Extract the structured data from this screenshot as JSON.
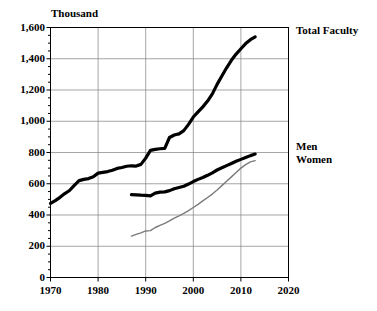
{
  "chart_data": {
    "type": "line",
    "title": "",
    "subtitle": "",
    "unit_label": "Thousand",
    "xlabel": "",
    "ylabel": "",
    "xlim": [
      1970,
      2020
    ],
    "ylim": [
      0,
      1600
    ],
    "grid": true,
    "legend_position": "right-inline",
    "x_ticks": [
      "1970",
      "1980",
      "1990",
      "2000",
      "2010",
      "2020"
    ],
    "x_tick_values": [
      1970,
      1980,
      1990,
      2000,
      2010,
      2020
    ],
    "y_ticks": [
      "0",
      "200",
      "400",
      "600",
      "800",
      "1,000",
      "1,200",
      "1,400",
      "1,600"
    ],
    "y_tick_values": [
      0,
      200,
      400,
      600,
      800,
      1000,
      1200,
      1400,
      1600
    ],
    "y_minor_step": 50,
    "series": [
      {
        "name": "Total Faculty",
        "color": "#000000",
        "width": 3.2,
        "x": [
          1970,
          1971,
          1972,
          1973,
          1974,
          1975,
          1976,
          1977,
          1978,
          1979,
          1980,
          1981,
          1982,
          1983,
          1984,
          1985,
          1986,
          1987,
          1988,
          1989,
          1990,
          1991,
          1992,
          1993,
          1994,
          1995,
          1996,
          1997,
          1998,
          1999,
          2000,
          2001,
          2002,
          2003,
          2004,
          2005,
          2006,
          2007,
          2008,
          2009,
          2010,
          2011,
          2012,
          2013
        ],
        "values": [
          474,
          492,
          513,
          537,
          557,
          590,
          620,
          628,
          633,
          645,
          668,
          673,
          678,
          686,
          698,
          704,
          712,
          715,
          713,
          724,
          764,
          814,
          820,
          824,
          826,
          896,
          912,
          919,
          940,
          980,
          1027,
          1060,
          1092,
          1129,
          1175,
          1236,
          1290,
          1342,
          1390,
          1430,
          1464,
          1497,
          1522,
          1540
        ]
      },
      {
        "name": "Men",
        "color": "#000000",
        "width": 3.2,
        "x": [
          1987,
          1988,
          1989,
          1990,
          1991,
          1992,
          1993,
          1994,
          1995,
          1996,
          1997,
          1998,
          1999,
          2000,
          2001,
          2002,
          2003,
          2004,
          2005,
          2006,
          2007,
          2008,
          2009,
          2010,
          2011,
          2012,
          2013
        ],
        "values": [
          530,
          529,
          527,
          526,
          522,
          540,
          546,
          548,
          556,
          568,
          576,
          584,
          598,
          614,
          628,
          640,
          654,
          670,
          688,
          702,
          716,
          730,
          744,
          756,
          768,
          780,
          790
        ]
      },
      {
        "name": "Women",
        "color": "#7a7a7a",
        "width": 1.4,
        "x": [
          1987,
          1988,
          1989,
          1990,
          1991,
          1992,
          1993,
          1994,
          1995,
          1996,
          1997,
          1998,
          1999,
          2000,
          2001,
          2002,
          2003,
          2004,
          2005,
          2006,
          2007,
          2008,
          2009,
          2010,
          2011,
          2012,
          2013
        ],
        "values": [
          265,
          276,
          286,
          298,
          300,
          320,
          334,
          346,
          362,
          380,
          394,
          410,
          428,
          448,
          468,
          490,
          512,
          534,
          560,
          588,
          616,
          644,
          672,
          700,
          722,
          740,
          748
        ]
      }
    ],
    "annotations": [
      {
        "text": "Total Faculty",
        "anchor_series": "Total Faculty",
        "side": "right"
      },
      {
        "text": "Men",
        "anchor_series": "Men",
        "side": "right"
      },
      {
        "text": "Women",
        "anchor_series": "Women",
        "side": "right"
      }
    ]
  },
  "labels": {
    "unit": "Thousand",
    "total_faculty": "Total Faculty",
    "men": "Men",
    "women": "Women"
  },
  "colors": {
    "axis": "#000000",
    "grid": "#808080",
    "total_faculty": "#000000",
    "men": "#000000",
    "women": "#7a7a7a",
    "background": "#ffffff"
  }
}
